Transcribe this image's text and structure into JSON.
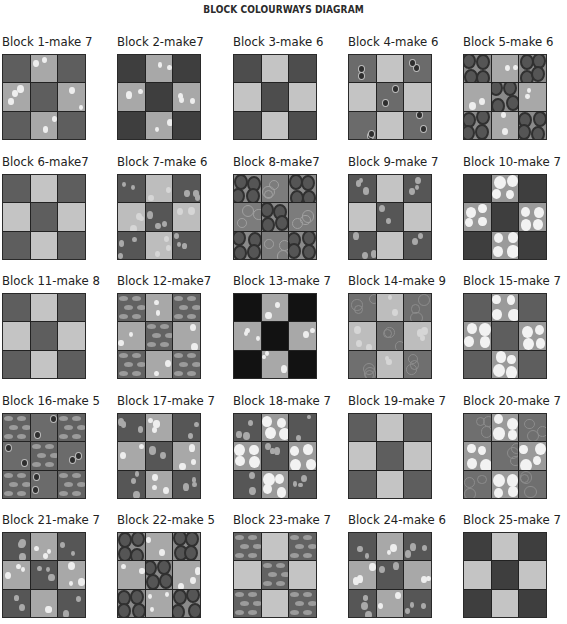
{
  "title": "BLOCK  COLOURWAYS DIAGRAM",
  "fabrics": {
    "mid_spot": {
      "base": "#6a6a6a",
      "spot": "#d9d9d9",
      "pattern": "spots"
    },
    "light_spot": {
      "base": "#a8a8a8",
      "spot": "#eeeeee",
      "pattern": "spots"
    },
    "dark_plain": {
      "base": "#4d4d4d",
      "spot": "#5a5a5a",
      "pattern": "faint"
    },
    "darker_plain": {
      "base": "#3e3e3e",
      "spot": "#4a4a4a",
      "pattern": "faint"
    },
    "pale_plain": {
      "base": "#c4c4c4",
      "spot": "#cfcfcf",
      "pattern": "faint"
    },
    "mid_dark_dots": {
      "base": "#6b6b6b",
      "spot": "#2e2e2e",
      "pattern": "darkdots"
    },
    "dark_ovals": {
      "base": "#8a8a8a",
      "spot": "#303030",
      "pattern": "ovals"
    },
    "dark_spot_light": {
      "base": "#565656",
      "spot": "#a9a9a9",
      "pattern": "spots"
    },
    "pale_spot": {
      "base": "#bdbdbd",
      "spot": "#d6d6d6",
      "pattern": "spots"
    },
    "grey_texture": {
      "base": "#7c7c7c",
      "spot": "#a0a0a0",
      "pattern": "bubbles"
    },
    "blobs_light": {
      "base": "#9a9a9a",
      "spot": "#f2f2f2",
      "pattern": "blobs"
    },
    "seed_ovals": {
      "base": "#626262",
      "spot": "#9b9b9b",
      "pattern": "seeds"
    },
    "black": {
      "base": "#121212",
      "spot": "#1a1a1a",
      "pattern": "faint"
    },
    "mottled": {
      "base": "#6f6f6f",
      "spot": "#8c8c8c",
      "pattern": "bubbles"
    },
    "mid_plain": {
      "base": "#5e5e5e",
      "spot": "#6a6a6a",
      "pattern": "faint"
    }
  },
  "blocks": [
    {
      "label": "Block 1-make 7",
      "corner": "mid_plain",
      "edge": "light_spot",
      "center": "mid_plain"
    },
    {
      "label": "Block 2-make7",
      "corner": "darker_plain",
      "edge": "light_spot",
      "center": "darker_plain"
    },
    {
      "label": "Block 3-make 6",
      "corner": "dark_plain",
      "edge": "pale_plain",
      "center": "dark_plain"
    },
    {
      "label": "Block 4-make 6",
      "corner": "mid_dark_dots",
      "edge": "pale_plain",
      "center": "mid_dark_dots"
    },
    {
      "label": "Block 5-make 6",
      "corner": "dark_ovals",
      "edge": "light_spot",
      "center": "dark_ovals"
    },
    {
      "label": "Block 6-make7",
      "corner": "mid_plain",
      "edge": "pale_plain",
      "center": "mid_plain"
    },
    {
      "label": "Block 7-make 6",
      "corner": "dark_spot_light",
      "edge": "pale_spot",
      "center": "dark_spot_light"
    },
    {
      "label": "Block 8-make7",
      "corner": "dark_ovals",
      "edge": "grey_texture",
      "center": "dark_ovals"
    },
    {
      "label": "Block 9-make 7",
      "corner": "dark_spot_light",
      "edge": "pale_plain",
      "center": "dark_spot_light"
    },
    {
      "label": "Block 10-make 7",
      "corner": "darker_plain",
      "edge": "blobs_light",
      "center": "darker_plain"
    },
    {
      "label": "Block 11-make 8",
      "corner": "mid_plain",
      "edge": "pale_plain",
      "center": "mid_plain"
    },
    {
      "label": "Block 12-make7",
      "corner": "seed_ovals",
      "edge": "light_spot",
      "center": "seed_ovals"
    },
    {
      "label": "Block 13-make 7",
      "corner": "black",
      "edge": "light_spot",
      "center": "black"
    },
    {
      "label": "Block 14-make 9",
      "corner": "mottled",
      "edge": "pale_spot",
      "center": "mottled"
    },
    {
      "label": "Block 15-make 7",
      "corner": "mid_plain",
      "edge": "blobs_light",
      "center": "mid_plain"
    },
    {
      "label": "Block 16-make 5",
      "corner": "seed_ovals",
      "edge": "mid_dark_dots",
      "center": "seed_ovals"
    },
    {
      "label": "Block 17-make 7",
      "corner": "dark_spot_light",
      "edge": "light_spot",
      "center": "dark_spot_light"
    },
    {
      "label": "Block 18-make 7",
      "corner": "dark_spot_light",
      "edge": "blobs_light",
      "center": "dark_spot_light"
    },
    {
      "label": "Block 19-make 7",
      "corner": "mid_plain",
      "edge": "pale_plain",
      "center": "mid_plain"
    },
    {
      "label": "Block 20-make 7",
      "corner": "mottled",
      "edge": "blobs_light",
      "center": "mottled"
    },
    {
      "label": "Block 21-make 7",
      "corner": "dark_spot_light",
      "edge": "light_spot",
      "center": "dark_spot_light"
    },
    {
      "label": "Block 22-make 5",
      "corner": "dark_ovals",
      "edge": "light_spot",
      "center": "dark_ovals"
    },
    {
      "label": "Block 23-make 7",
      "corner": "seed_ovals",
      "edge": "pale_plain",
      "center": "seed_ovals"
    },
    {
      "label": "Block 24-make 6",
      "corner": "dark_spot_light",
      "edge": "light_spot",
      "center": "dark_spot_light"
    },
    {
      "label": "Block 25-make 7",
      "corner": "darker_plain",
      "edge": "pale_plain",
      "center": "darker_plain"
    }
  ],
  "layout": {
    "col_x": [
      2,
      117,
      233,
      348,
      463
    ],
    "row_y": [
      34,
      154,
      273,
      393,
      512
    ]
  }
}
